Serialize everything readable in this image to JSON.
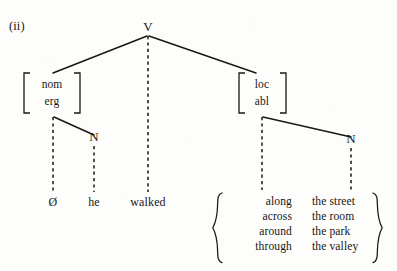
{
  "figure": {
    "example_label": "(ii)",
    "type": "dependency-tree",
    "ink_color": "#1a1714",
    "background_color": "#fdfdfc"
  },
  "tree": {
    "root": {
      "label": "V",
      "x": 148,
      "y": 31
    },
    "nodes": [
      {
        "id": "nom-erg",
        "kind": "feature-bracket",
        "features": [
          "nom",
          "erg"
        ],
        "x": 52,
        "y": 92,
        "bracket": "square"
      },
      {
        "id": "loc-abl",
        "kind": "feature-bracket",
        "features": [
          "loc",
          "abl"
        ],
        "x": 262,
        "y": 92,
        "bracket": "square"
      },
      {
        "id": "n-left",
        "kind": "category",
        "label": "N",
        "x": 94,
        "y": 141
      },
      {
        "id": "n-right",
        "kind": "category",
        "label": "N",
        "x": 351,
        "y": 143
      }
    ],
    "edges": [
      {
        "from": "V",
        "to": "nom-erg",
        "style": "solid"
      },
      {
        "from": "V",
        "to": "walked",
        "style": "dashed"
      },
      {
        "from": "V",
        "to": "loc-abl",
        "style": "solid"
      },
      {
        "from": "nom-erg",
        "to": "zero",
        "style": "dashed"
      },
      {
        "from": "nom-erg",
        "to": "n-left",
        "style": "solid"
      },
      {
        "from": "n-left",
        "to": "he",
        "style": "dashed"
      },
      {
        "from": "loc-abl",
        "to": "prep",
        "style": "dashed"
      },
      {
        "from": "loc-abl",
        "to": "n-right",
        "style": "solid"
      },
      {
        "from": "n-right",
        "to": "nouns",
        "style": "dashed"
      }
    ]
  },
  "leaves": [
    {
      "id": "zero",
      "text": "Ø",
      "x": 53,
      "y": 202
    },
    {
      "id": "he",
      "text": "he",
      "x": 94,
      "y": 202
    },
    {
      "id": "walked",
      "text": "walked",
      "x": 148,
      "y": 202
    }
  ],
  "alternation_set": {
    "brace_left_x": 216,
    "brace_right_x": 379,
    "top_y": 193,
    "bottom_y": 263,
    "columns": [
      {
        "id": "prep",
        "align": "right",
        "x": 292,
        "items": [
          "along",
          "across",
          "around",
          "through"
        ]
      },
      {
        "id": "nouns",
        "align": "left",
        "x": 312,
        "items": [
          "the street",
          "the room",
          "the park",
          "the valley"
        ]
      }
    ]
  }
}
